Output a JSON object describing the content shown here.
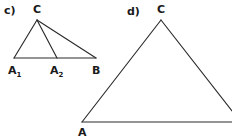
{
  "figure": {
    "background_color": "#ffffff",
    "line_color": "#2b2b2b",
    "text_color": "#1a1a1a",
    "width": 232,
    "height": 139,
    "panels": [
      {
        "id": "panel-c",
        "part_label": "c)",
        "part_label_x": 4,
        "part_label_y": 14,
        "description": "Obtuse-looking triangle A1-B-C with an interior cevian from C to A2 on the base",
        "vertices": [
          {
            "name": "C",
            "label": "C",
            "x": 37,
            "y": 20,
            "label_x": 33,
            "label_y": 13
          },
          {
            "name": "A1",
            "label": "A",
            "sub": "1",
            "x": 14,
            "y": 58,
            "label_x": 8,
            "label_y": 74
          },
          {
            "name": "A2",
            "label": "A",
            "sub": "2",
            "x": 57,
            "y": 58,
            "label_x": 50,
            "label_y": 74
          },
          {
            "name": "B",
            "label": "B",
            "x": 96,
            "y": 58,
            "label_x": 92,
            "label_y": 74
          }
        ],
        "segments": [
          {
            "name": "side-A1-C",
            "from": "A1",
            "to": "C"
          },
          {
            "name": "side-C-B",
            "from": "C",
            "to": "B"
          },
          {
            "name": "base-A1-B",
            "from": "A1",
            "to": "B"
          },
          {
            "name": "cevian-C-A2",
            "from": "C",
            "to": "A2"
          }
        ]
      },
      {
        "id": "panel-d",
        "part_label": "d)",
        "part_label_x": 127,
        "part_label_y": 15,
        "description": "Large triangle with apex C, left vertex A, right side running off the right edge of the frame",
        "vertices": [
          {
            "name": "C",
            "label": "C",
            "x": 161,
            "y": 20,
            "label_x": 157,
            "label_y": 13
          },
          {
            "name": "A",
            "label": "A",
            "x": 82,
            "y": 122,
            "label_x": 78,
            "label_y": 136
          }
        ],
        "segments": [
          {
            "name": "side-A-C",
            "from": "A",
            "to": "C"
          },
          {
            "name": "side-C-right",
            "from": "C",
            "to": "edge-right"
          },
          {
            "name": "base-A-right",
            "from": "A",
            "to": "edge-right-base"
          }
        ],
        "edge_points": {
          "edge-right": {
            "x": 232,
            "y": 111
          },
          "edge-right-base": {
            "x": 232,
            "y": 122
          }
        }
      }
    ]
  }
}
